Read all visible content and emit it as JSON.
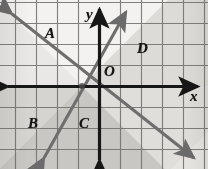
{
  "figure": {
    "type": "coordinate-plane-graph",
    "title": "",
    "background_color": "#e3e1de",
    "grid": {
      "visible": true,
      "line_color": "#6e6c69",
      "spacing_px": 21,
      "origin_px": {
        "x": 99,
        "y": 86
      }
    },
    "axes": {
      "x_label": "x",
      "y_label": "y",
      "origin_label": "O",
      "axis_color": "#171717",
      "x_axis_y_px": 86,
      "y_axis_x_px": 99,
      "arrowheads": [
        "left",
        "right",
        "up",
        "down"
      ]
    },
    "lines": [
      {
        "name": "descending-line",
        "slope": -1,
        "color": "#6b6b6b",
        "from_px": {
          "x": 8,
          "y": 10
        },
        "to_px": {
          "x": 196,
          "y": 160
        },
        "arrowheads": [
          "start",
          "end"
        ]
      },
      {
        "name": "ascending-line",
        "slope": 1,
        "color": "#6b6b6b",
        "from_px": {
          "x": 40,
          "y": 160
        },
        "to_px": {
          "x": 130,
          "y": 10
        },
        "arrowheads": [
          "start",
          "end"
        ]
      }
    ],
    "regions": [
      {
        "id": "A",
        "label": "A",
        "label_px": {
          "x": 45,
          "y": 33
        },
        "shading": "light",
        "fill": "#f2f1ef"
      },
      {
        "id": "B",
        "label": "B",
        "label_px": {
          "x": 28,
          "y": 122
        },
        "shading": "medium",
        "fill": "#d7d5d2"
      },
      {
        "id": "C",
        "label": "C",
        "label_px": {
          "x": 79,
          "y": 122
        },
        "shading": "dark",
        "fill": "#c4c2bf"
      },
      {
        "id": "D",
        "label": "D",
        "label_px": {
          "x": 137,
          "y": 47
        },
        "shading": "medium",
        "fill": "#d9d7d4"
      }
    ],
    "region_labels": [
      "A",
      "B",
      "C",
      "D"
    ]
  }
}
